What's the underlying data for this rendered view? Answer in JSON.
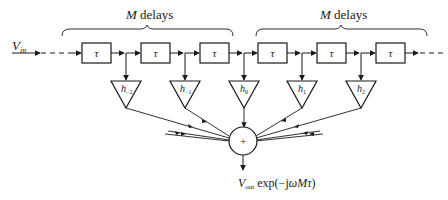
{
  "diagram": {
    "type": "transversal-filter-block-diagram",
    "input_label": "V",
    "input_sub": "in",
    "brace_labels": [
      {
        "italic": "M",
        "text": " delays"
      },
      {
        "italic": "M",
        "text": " delays"
      }
    ],
    "delay_label": "τ",
    "delays": [
      "τ",
      "τ",
      "τ",
      "τ",
      "τ",
      "τ"
    ],
    "taps": [
      {
        "label": "h",
        "sub": "−2"
      },
      {
        "label": "h",
        "sub": "−1"
      },
      {
        "label": "h",
        "sub": "0"
      },
      {
        "label": "h",
        "sub": "1"
      },
      {
        "label": "h",
        "sub": "2"
      }
    ],
    "summer_symbol": "+",
    "output_label": "V",
    "output_sub": "out",
    "output_expr": " exp(−jωMτ)",
    "colors": {
      "line": "#1a1a1a",
      "background": "#ffffff"
    }
  }
}
